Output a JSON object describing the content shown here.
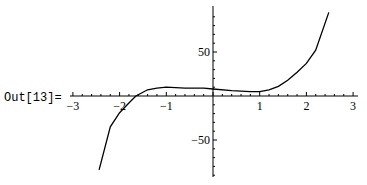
{
  "cell": {
    "out_label": "Out[13]="
  },
  "chart_data": {
    "type": "line",
    "title": "",
    "xlabel": "",
    "ylabel": "",
    "xlim": [
      -3,
      3
    ],
    "ylim": [
      -85,
      95
    ],
    "grid": false,
    "legend": null,
    "x_ticks": [
      -3,
      -2,
      -1,
      1,
      2,
      3
    ],
    "x_tick_labels": [
      "-3",
      "-2",
      "-1",
      "1",
      "2",
      "3"
    ],
    "y_ticks": [
      50,
      -50
    ],
    "y_tick_labels": [
      "50",
      "-50"
    ],
    "series": [
      {
        "name": "f(x)",
        "x": [
          -2.44,
          -2.2,
          -2.0,
          -1.8,
          -1.65,
          -1.4,
          -1.2,
          -1.0,
          -0.6,
          -0.2,
          0.0,
          0.4,
          0.8,
          1.0,
          1.2,
          1.4,
          1.6,
          1.8,
          2.0,
          2.2,
          2.48
        ],
        "y": [
          -84,
          -35,
          -19,
          -8,
          0,
          7,
          9,
          10,
          9,
          9,
          8,
          6,
          5,
          5,
          7,
          11,
          18,
          27,
          37,
          52,
          95
        ]
      }
    ]
  }
}
